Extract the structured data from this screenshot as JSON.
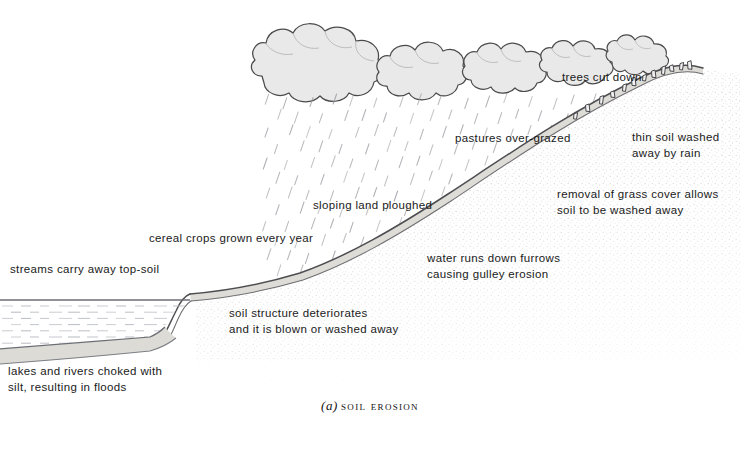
{
  "figure": {
    "caption_letter": "(a)",
    "caption_title": "soil erosion"
  },
  "annotations": [
    {
      "id": "trees-cut-down",
      "text": "trees cut down",
      "x": 562,
      "y": 76,
      "align": "left"
    },
    {
      "id": "thin-soil-washed-away-by-rain",
      "text": "thin soil washed\naway by rain",
      "x": 632,
      "y": 130,
      "align": "left"
    },
    {
      "id": "pastures-over-grazed",
      "text": "pastures over-grazed",
      "x": 455,
      "y": 131,
      "align": "left"
    },
    {
      "id": "removal-of-grass-cover",
      "text": "removal of grass cover allows\nsoil to be washed away",
      "x": 557,
      "y": 187,
      "align": "left"
    },
    {
      "id": "sloping-land-ploughed",
      "text": "sloping land ploughed",
      "x": 313,
      "y": 199,
      "align": "left"
    },
    {
      "id": "cereal-crops-grown-every-year",
      "text": "cereal crops grown every year",
      "x": 149,
      "y": 231,
      "align": "left"
    },
    {
      "id": "water-runs-down-furrows",
      "text": "water runs down furrows\ncausing gulley erosion",
      "x": 427,
      "y": 251,
      "align": "left"
    },
    {
      "id": "streams-carry-away-top-soil",
      "text": "streams carry away top-soil",
      "x": 10,
      "y": 263,
      "align": "left"
    },
    {
      "id": "soil-structure-deteriorates",
      "text": "soil structure deteriorates\nand it is blown or washed away",
      "x": 229,
      "y": 306,
      "align": "left"
    },
    {
      "id": "lakes-and-rivers-choked-with-silt",
      "text": "lakes and rivers choked with\nsilt, resulting in floods",
      "x": 8,
      "y": 364,
      "align": "left"
    }
  ],
  "chart_data": {
    "type": "diagram",
    "elements": [
      {
        "name": "rain-clouds",
        "count": 10,
        "region": "top-centre"
      },
      {
        "name": "rain-streaks",
        "region": "below-clouds-over-slope"
      },
      {
        "name": "hill-slope",
        "region": "centre-to-right, rising left-to-right"
      },
      {
        "name": "thin-topsoil-layer",
        "region": "along-slope-surface"
      },
      {
        "name": "tree-stumps",
        "count": 11,
        "region": "upper-slope"
      },
      {
        "name": "lake-water",
        "region": "lower-left"
      },
      {
        "name": "silt-deposit",
        "region": "lake-bed"
      }
    ]
  },
  "colors": {
    "ink": "#1a1a1a",
    "outline": "#55555a",
    "cloud_fill": "#e8e8e8",
    "cloud_edge": "#4a4a4a",
    "soil_band": "#dddcd8",
    "water_hatch": "#b9bcc2",
    "silt_fill": "#d8d8d4",
    "stipple": "#9a9a9a",
    "rain": "#9b9ba2",
    "background": "#ffffff"
  }
}
